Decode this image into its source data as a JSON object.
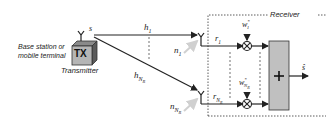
{
  "transmitter": {
    "description_line1": "Base station or",
    "description_line2": "mobile terminal",
    "box_label": "TX",
    "caption": "Transmitter",
    "signal": "s"
  },
  "channels": [
    {
      "gain": "h",
      "sub": "1",
      "noise": "n",
      "noise_sub": "1"
    },
    {
      "gain": "h",
      "sub": "N",
      "subsub": "R",
      "noise": "n",
      "noise_sub": "N",
      "noise_subsub": "R"
    }
  ],
  "receiver": {
    "title": "Receiver",
    "branches": [
      {
        "signal": "r",
        "sub": "1",
        "weight": "w",
        "weight_sup": "*",
        "weight_sub": "1"
      },
      {
        "signal": "r",
        "sub": "N",
        "subsub": "R",
        "weight": "w",
        "weight_sup": "*",
        "weight_sub": "N",
        "weight_subsub": "R"
      }
    ],
    "combiner_symbol": "+",
    "output": "ŝ"
  },
  "colors": {
    "line": "#222222",
    "box_fill": "#c0c0c0",
    "tx_front": "#b5b5b5",
    "noise_arrow": "#cfcfcf"
  }
}
